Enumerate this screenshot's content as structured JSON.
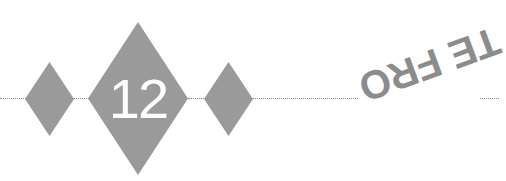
{
  "chapter_ornament": {
    "number": "12",
    "fill_color": "#9a9a9a",
    "rule_color": "#8a8a8a"
  },
  "bleed_through_text": "TE FRO"
}
